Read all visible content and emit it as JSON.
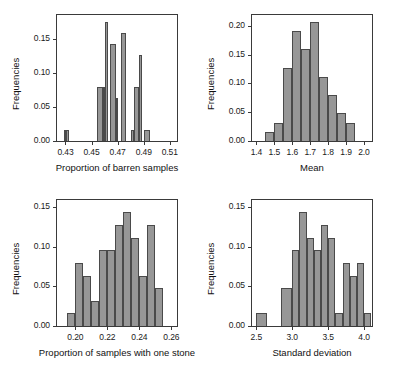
{
  "figure": {
    "background": "#ffffff",
    "bar_fill": "#979797",
    "bar_edge": "#4a4a4a",
    "axis_color": "#3a3a3a",
    "panel_count": 4
  },
  "chart_data": [
    {
      "type": "bar",
      "panel": "top-left",
      "title": "",
      "xlabel": "Proportion of barren samples",
      "ylabel": "Frequencies",
      "xlim": [
        0.4235,
        0.5155
      ],
      "ylim": [
        0.0,
        0.1855
      ],
      "grid": false,
      "legend": null,
      "xticks": [
        0.43,
        0.45,
        0.47,
        0.49,
        0.51
      ],
      "xtick_labels": [
        "0.43",
        "0.45",
        "0.47",
        "0.49",
        "0.51"
      ],
      "yticks": [
        0.0,
        0.05,
        0.1,
        0.15
      ],
      "ytick_labels": [
        "0.00",
        "0.05",
        "0.10",
        "0.15"
      ],
      "bin_edges": [
        0.4285,
        0.4305,
        0.4325,
        0.4345,
        0.4545,
        0.4565,
        0.4585,
        0.4605,
        0.4625,
        0.4645,
        0.4665,
        0.4685,
        0.4705,
        0.4725,
        0.4745,
        0.4765,
        0.4785,
        0.4805,
        0.4825,
        0.4845,
        0.4865,
        0.4885,
        0.4905,
        0.4925
      ],
      "bars": [
        {
          "x0": 0.4285,
          "x1": 0.4305,
          "value": 0.016
        },
        {
          "x0": 0.4305,
          "x1": 0.4325,
          "value": 0.016
        },
        {
          "x0": 0.4545,
          "x1": 0.4585,
          "value": 0.079
        },
        {
          "x0": 0.4585,
          "x1": 0.4605,
          "value": 0.079
        },
        {
          "x0": 0.4605,
          "x1": 0.4625,
          "value": 0.175
        },
        {
          "x0": 0.4645,
          "x1": 0.4685,
          "value": 0.143
        },
        {
          "x0": 0.4685,
          "x1": 0.4705,
          "value": 0.063
        },
        {
          "x0": 0.4725,
          "x1": 0.4765,
          "value": 0.159
        },
        {
          "x0": 0.4805,
          "x1": 0.4825,
          "value": 0.016
        },
        {
          "x0": 0.4825,
          "x1": 0.4865,
          "value": 0.079
        },
        {
          "x0": 0.4865,
          "x1": 0.4885,
          "value": 0.127
        },
        {
          "x0": 0.4905,
          "x1": 0.4945,
          "value": 0.016
        }
      ]
    },
    {
      "type": "bar",
      "panel": "top-right",
      "title": "",
      "xlabel": "Mean",
      "ylabel": "Frequencies",
      "xlim": [
        1.375,
        2.045
      ],
      "ylim": [
        0.0,
        0.2185
      ],
      "grid": false,
      "legend": null,
      "xticks": [
        1.4,
        1.5,
        1.6,
        1.7,
        1.8,
        1.9,
        2.0
      ],
      "xtick_labels": [
        "1.4",
        "1.5",
        "1.6",
        "1.7",
        "1.8",
        "1.9",
        "2.0"
      ],
      "yticks": [
        0.0,
        0.05,
        0.1,
        0.15,
        0.2
      ],
      "ytick_labels": [
        "0.00",
        "0.05",
        "0.10",
        "0.15",
        "0.20"
      ],
      "bin_edges": [
        1.45,
        1.5,
        1.55,
        1.6,
        1.65,
        1.7,
        1.75,
        1.8,
        1.85,
        1.9,
        1.95
      ],
      "bars": [
        {
          "x0": 1.45,
          "x1": 1.5,
          "value": 0.016
        },
        {
          "x0": 1.5,
          "x1": 1.55,
          "value": 0.032
        },
        {
          "x0": 1.55,
          "x1": 1.6,
          "value": 0.127
        },
        {
          "x0": 1.6,
          "x1": 1.65,
          "value": 0.19
        },
        {
          "x0": 1.65,
          "x1": 1.7,
          "value": 0.159
        },
        {
          "x0": 1.7,
          "x1": 1.75,
          "value": 0.206
        },
        {
          "x0": 1.75,
          "x1": 1.8,
          "value": 0.111
        },
        {
          "x0": 1.8,
          "x1": 1.85,
          "value": 0.079
        },
        {
          "x0": 1.85,
          "x1": 1.9,
          "value": 0.048
        },
        {
          "x0": 1.9,
          "x1": 1.95,
          "value": 0.032
        }
      ]
    },
    {
      "type": "bar",
      "panel": "bottom-left",
      "title": "",
      "xlabel": "Proportion of samples with one stone",
      "ylabel": "Frequencies",
      "xlim": [
        0.1885,
        0.2635
      ],
      "ylim": [
        0.0,
        0.1585
      ],
      "grid": false,
      "legend": null,
      "xticks": [
        0.2,
        0.22,
        0.24,
        0.26
      ],
      "xtick_labels": [
        "0.20",
        "0.22",
        "0.24",
        "0.26"
      ],
      "yticks": [
        0.0,
        0.05,
        0.1,
        0.15
      ],
      "ytick_labels": [
        "0.00",
        "0.05",
        "0.10",
        "0.15"
      ],
      "bin_edges": [
        0.195,
        0.2,
        0.205,
        0.21,
        0.215,
        0.22,
        0.225,
        0.23,
        0.235,
        0.24,
        0.245,
        0.25,
        0.255
      ],
      "bars": [
        {
          "x0": 0.195,
          "x1": 0.2,
          "value": 0.016
        },
        {
          "x0": 0.2,
          "x1": 0.205,
          "value": 0.079
        },
        {
          "x0": 0.205,
          "x1": 0.21,
          "value": 0.063
        },
        {
          "x0": 0.21,
          "x1": 0.215,
          "value": 0.032
        },
        {
          "x0": 0.215,
          "x1": 0.22,
          "value": 0.095
        },
        {
          "x0": 0.22,
          "x1": 0.225,
          "value": 0.095
        },
        {
          "x0": 0.225,
          "x1": 0.23,
          "value": 0.127
        },
        {
          "x0": 0.23,
          "x1": 0.235,
          "value": 0.143
        },
        {
          "x0": 0.235,
          "x1": 0.24,
          "value": 0.111
        },
        {
          "x0": 0.24,
          "x1": 0.245,
          "value": 0.063
        },
        {
          "x0": 0.245,
          "x1": 0.25,
          "value": 0.127
        },
        {
          "x0": 0.25,
          "x1": 0.255,
          "value": 0.048
        }
      ]
    },
    {
      "type": "bar",
      "panel": "bottom-right",
      "title": "",
      "xlabel": "Standard deviation",
      "ylabel": "Frequencies",
      "xlim": [
        2.44,
        4.11
      ],
      "ylim": [
        0.0,
        0.1585
      ],
      "grid": false,
      "legend": null,
      "xticks": [
        2.5,
        3.0,
        3.5,
        4.0
      ],
      "xtick_labels": [
        "2.5",
        "3.0",
        "3.5",
        "4.0"
      ],
      "yticks": [
        0.0,
        0.05,
        0.1,
        0.15
      ],
      "ytick_labels": [
        "0.00",
        "0.05",
        "0.10",
        "0.15"
      ],
      "bin_edges": [
        2.5,
        2.65,
        2.85,
        3.0,
        3.1,
        3.2,
        3.3,
        3.4,
        3.5,
        3.6,
        3.7,
        3.8,
        3.9,
        4.0
      ],
      "bars": [
        {
          "x0": 2.5,
          "x1": 2.65,
          "value": 0.016
        },
        {
          "x0": 2.85,
          "x1": 3.0,
          "value": 0.048
        },
        {
          "x0": 3.0,
          "x1": 3.1,
          "value": 0.095
        },
        {
          "x0": 3.1,
          "x1": 3.2,
          "value": 0.143
        },
        {
          "x0": 3.2,
          "x1": 3.3,
          "value": 0.111
        },
        {
          "x0": 3.3,
          "x1": 3.4,
          "value": 0.095
        },
        {
          "x0": 3.4,
          "x1": 3.5,
          "value": 0.127
        },
        {
          "x0": 3.5,
          "x1": 3.6,
          "value": 0.111
        },
        {
          "x0": 3.6,
          "x1": 3.7,
          "value": 0.016
        },
        {
          "x0": 3.7,
          "x1": 3.8,
          "value": 0.079
        },
        {
          "x0": 3.8,
          "x1": 3.9,
          "value": 0.063
        },
        {
          "x0": 3.9,
          "x1": 4.0,
          "value": 0.079
        },
        {
          "x0": 4.0,
          "x1": 4.1,
          "value": 0.016
        }
      ]
    }
  ]
}
